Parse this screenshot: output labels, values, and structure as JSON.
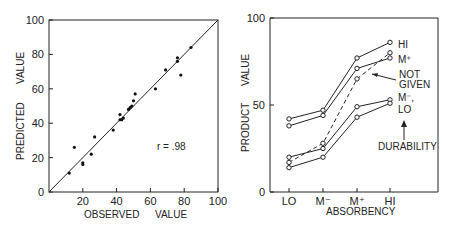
{
  "chart_data": [
    {
      "type": "scatter",
      "title": "",
      "xlabel": "OBSERVED VALUE",
      "ylabel": "PREDICTED VALUE",
      "xlim": [
        0,
        100
      ],
      "ylim": [
        0,
        100
      ],
      "xticks": [
        "20",
        "40",
        "60",
        "80",
        "100"
      ],
      "yticks": [
        "0",
        "20",
        "40",
        "60",
        "80",
        "100"
      ],
      "annotation": "r = .98",
      "reference_line": "y = x",
      "points": [
        [
          12,
          11
        ],
        [
          15,
          26
        ],
        [
          20,
          16
        ],
        [
          20,
          17
        ],
        [
          25,
          22
        ],
        [
          27,
          32
        ],
        [
          38,
          36
        ],
        [
          42,
          45
        ],
        [
          42,
          42
        ],
        [
          43,
          42
        ],
        [
          44,
          43
        ],
        [
          47,
          48
        ],
        [
          48,
          49
        ],
        [
          49,
          50
        ],
        [
          50,
          53
        ],
        [
          51,
          57
        ],
        [
          63,
          60
        ],
        [
          69,
          71
        ],
        [
          76,
          76
        ],
        [
          76,
          78
        ],
        [
          78,
          68
        ],
        [
          84,
          84
        ]
      ]
    },
    {
      "type": "line",
      "title": "",
      "xlabel": "ABSORBENCY",
      "ylabel": "PRODUCT VALUE",
      "categories": [
        "LO",
        "M⁻",
        "M⁺",
        "HI"
      ],
      "ylim": [
        0,
        100
      ],
      "yticks": [
        "0",
        "50",
        "100"
      ],
      "legend_title": "DURABILITY",
      "series": [
        {
          "name": "HI",
          "values": [
            42,
            47,
            77,
            86
          ],
          "style": "solid"
        },
        {
          "name": "M⁺",
          "values": [
            38,
            44,
            71,
            77
          ],
          "style": "solid"
        },
        {
          "name": "NOT GIVEN",
          "values": [
            17,
            28,
            65,
            80
          ],
          "style": "dashed"
        },
        {
          "name": "M⁻",
          "values": [
            20,
            25,
            49,
            53
          ],
          "style": "solid"
        },
        {
          "name": "LO",
          "values": [
            14,
            20,
            43,
            51
          ],
          "style": "solid"
        }
      ]
    }
  ],
  "left": {
    "yticks": [
      "0",
      "20",
      "40",
      "60",
      "80",
      "100"
    ],
    "xticks": [
      "20",
      "40",
      "60",
      "80",
      "100"
    ],
    "xlabel_a": "OBSERVED",
    "xlabel_b": "VALUE",
    "ylabel_a": "PREDICTED",
    "ylabel_b": "VALUE",
    "r_label": "r = .98"
  },
  "right": {
    "yticks": [
      "0",
      "50",
      "100"
    ],
    "xticks": [
      "LO",
      "M⁻",
      "M⁺",
      "HI"
    ],
    "xlabel": "ABSORBENCY",
    "ylabel_a": "PRODUCT",
    "ylabel_b": "VALUE",
    "labels": {
      "hi": "HI",
      "mplus": "M⁺",
      "not": "NOT",
      "given": "GIVEN",
      "mminus": "M⁻,",
      "lo": "LO",
      "durability": "DURABILITY"
    }
  }
}
